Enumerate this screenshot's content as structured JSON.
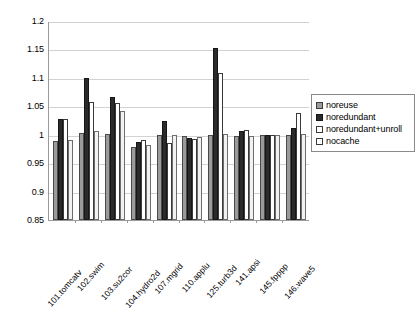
{
  "chart_data": {
    "type": "bar",
    "title": "",
    "xlabel": "",
    "ylabel": "",
    "ylim": [
      0.85,
      1.2
    ],
    "yticks": [
      "0.85",
      "0.9",
      "0.95",
      "1",
      "1.05",
      "1.1",
      "1.15",
      "1.2"
    ],
    "ytick_values": [
      0.85,
      0.9,
      0.95,
      1.0,
      1.05,
      1.1,
      1.15,
      1.2
    ],
    "grid": true,
    "legend_position": "right",
    "categories": [
      "101.tomcatv",
      "102.swim",
      "103.su2cor",
      "104.hydro2d",
      "107.mgrid",
      "110.applu",
      "125.turb3d",
      "141.apsi",
      "145.fpppp",
      "146.wave5"
    ],
    "series": [
      {
        "name": "noreuse",
        "color": "#9b9b9b",
        "values": [
          0.989,
          1.003,
          1.001,
          0.978,
          1.0,
          0.997,
          1.0,
          0.998,
          1.0,
          0.999
        ]
      },
      {
        "name": "noredundant",
        "color": "#2b2b2b",
        "values": [
          1.027,
          1.1,
          1.067,
          0.988,
          1.024,
          0.994,
          1.153,
          1.006,
          1.0,
          1.011
        ]
      },
      {
        "name": "noredundant+unroll",
        "color": "#ffffff",
        "values": [
          1.027,
          1.058,
          1.055,
          0.99,
          0.985,
          0.993,
          1.108,
          1.009,
          1.0,
          1.038
        ]
      },
      {
        "name": "nocache",
        "color": "#ffffff",
        "values": [
          0.99,
          1.006,
          1.041,
          0.982,
          1.0,
          0.996,
          1.001,
          0.998,
          1.0,
          1.001
        ]
      }
    ]
  },
  "legend": {
    "items": [
      {
        "label": "noreuse"
      },
      {
        "label": "noredundant"
      },
      {
        "label": "noredundant+unroll"
      },
      {
        "label": "nocache"
      }
    ]
  }
}
